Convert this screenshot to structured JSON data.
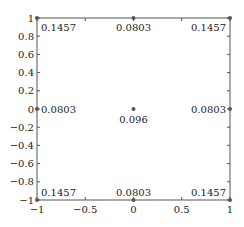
{
  "chart_data": {
    "type": "scatter",
    "title": "",
    "xlabel": "",
    "ylabel": "",
    "xlim": [
      -1,
      1
    ],
    "ylim": [
      -1,
      1
    ],
    "grid": false,
    "legend": null,
    "x_ticks": [
      "−1",
      "−0.5",
      "0",
      "0.5",
      "1"
    ],
    "y_ticks": [
      "−1",
      "−0.8",
      "−0.6",
      "−0.4",
      "−0.2",
      "0",
      "0.2",
      "0.4",
      "0.6",
      "0.8",
      "1"
    ],
    "points": [
      {
        "x": -1,
        "y": 1,
        "label": "0.1457"
      },
      {
        "x": 0,
        "y": 1,
        "label": "0.0803"
      },
      {
        "x": 1,
        "y": 1,
        "label": "0.1457"
      },
      {
        "x": -1,
        "y": 0,
        "label": "0.0803"
      },
      {
        "x": 0,
        "y": 0,
        "label": "0.096"
      },
      {
        "x": 1,
        "y": 0,
        "label": "0.0803"
      },
      {
        "x": -1,
        "y": -1,
        "label": "0.1457"
      },
      {
        "x": 0,
        "y": -1,
        "label": "0.0803"
      },
      {
        "x": 1,
        "y": -1,
        "label": "0.1457"
      }
    ],
    "colors": {
      "axis": "#555555",
      "point": "#555555",
      "text": "#222222"
    }
  }
}
